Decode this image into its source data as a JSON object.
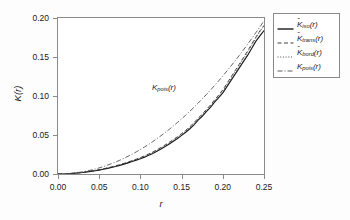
{
  "chart_data": {
    "type": "line",
    "title": "",
    "xlabel": "r",
    "ylabel": "K(r)",
    "xlim": [
      0.0,
      0.25
    ],
    "ylim": [
      0.0,
      0.2
    ],
    "xticks": [
      "0.00",
      "0.05",
      "0.10",
      "0.15",
      "0.20",
      "0.25"
    ],
    "xtick_values": [
      0.0,
      0.05,
      0.1,
      0.15,
      0.2,
      0.25
    ],
    "yticks": [
      "0.00",
      "0.05",
      "0.10",
      "0.15",
      "0.20"
    ],
    "ytick_values": [
      0.0,
      0.05,
      0.1,
      0.15,
      0.2
    ],
    "grid": false,
    "legend_position": "right-outside",
    "annotations": [
      {
        "text_prefix": "K",
        "text_sub": "pois",
        "text_suffix": "(r)",
        "x": 0.152,
        "y": 0.112
      }
    ],
    "x": [
      0.0,
      0.005,
      0.01,
      0.015,
      0.02,
      0.025,
      0.03,
      0.035,
      0.04,
      0.045,
      0.05,
      0.055,
      0.06,
      0.065,
      0.07,
      0.075,
      0.08,
      0.085,
      0.09,
      0.095,
      0.1,
      0.105,
      0.11,
      0.115,
      0.12,
      0.125,
      0.13,
      0.135,
      0.14,
      0.145,
      0.15,
      0.155,
      0.16,
      0.165,
      0.17,
      0.175,
      0.18,
      0.185,
      0.19,
      0.195,
      0.2,
      0.205,
      0.21,
      0.215,
      0.22,
      0.225,
      0.23,
      0.235,
      0.24,
      0.245,
      0.25
    ],
    "series": [
      {
        "name": "K_iso",
        "label_prefix": "K",
        "label_sub": "iso",
        "label_suffix": "(r)",
        "hat": true,
        "style": "solid",
        "color": "#1a1a1a",
        "values": [
          0.0,
          0.0,
          0.0,
          0.0005,
          0.0009,
          0.0014,
          0.0019,
          0.0026,
          0.0033,
          0.0041,
          0.005,
          0.0061,
          0.0072,
          0.0084,
          0.0096,
          0.011,
          0.0126,
          0.0143,
          0.016,
          0.0178,
          0.0196,
          0.0216,
          0.024,
          0.0264,
          0.0292,
          0.032,
          0.0352,
          0.0385,
          0.042,
          0.0455,
          0.0495,
          0.0535,
          0.058,
          0.063,
          0.069,
          0.074,
          0.08,
          0.0855,
          0.092,
          0.098,
          0.104,
          0.112,
          0.12,
          0.128,
          0.136,
          0.144,
          0.152,
          0.161,
          0.17,
          0.177,
          0.184
        ]
      },
      {
        "name": "K_trans",
        "label_prefix": "K",
        "label_sub": "trans",
        "label_suffix": "(r)",
        "hat": true,
        "style": "dashed",
        "color": "#2a2a2a",
        "values": [
          0.0,
          0.0,
          0.0001,
          0.0006,
          0.0011,
          0.0016,
          0.0022,
          0.0029,
          0.0037,
          0.0046,
          0.0056,
          0.0067,
          0.0079,
          0.0092,
          0.0105,
          0.012,
          0.0136,
          0.0154,
          0.0172,
          0.019,
          0.021,
          0.0232,
          0.0256,
          0.0282,
          0.031,
          0.034,
          0.0372,
          0.0406,
          0.0442,
          0.0478,
          0.0518,
          0.056,
          0.0606,
          0.0658,
          0.0714,
          0.0768,
          0.0826,
          0.0884,
          0.095,
          0.1012,
          0.108,
          0.116,
          0.1244,
          0.1326,
          0.1408,
          0.1492,
          0.1576,
          0.1664,
          0.1752,
          0.1834,
          0.1905
        ]
      },
      {
        "name": "K_bord",
        "label_prefix": "K",
        "label_sub": "bord",
        "label_suffix": "(r)",
        "hat": true,
        "style": "dotted",
        "color": "#3a3a3a",
        "values": [
          0.0,
          0.0,
          0.0001,
          0.0005,
          0.001,
          0.0015,
          0.002,
          0.0027,
          0.0035,
          0.0043,
          0.0053,
          0.0064,
          0.0076,
          0.0088,
          0.0101,
          0.0116,
          0.0132,
          0.0149,
          0.0166,
          0.0185,
          0.0205,
          0.0226,
          0.025,
          0.0275,
          0.0303,
          0.0332,
          0.0364,
          0.0398,
          0.0433,
          0.047,
          0.0509,
          0.055,
          0.0596,
          0.0648,
          0.0704,
          0.0756,
          0.0814,
          0.0872,
          0.0936,
          0.0998,
          0.1064,
          0.1144,
          0.1228,
          0.131,
          0.1392,
          0.1476,
          0.156,
          0.165,
          0.174,
          0.1825,
          0.19
        ]
      },
      {
        "name": "K_pois",
        "label_prefix": "K",
        "label_sub": "pois",
        "label_suffix": "(r)",
        "hat": false,
        "style": "dashdot",
        "color": "#4a4a4a",
        "values": [
          0.0,
          8e-05,
          0.00031,
          0.00071,
          0.00126,
          0.00196,
          0.00283,
          0.00385,
          0.00503,
          0.00636,
          0.00785,
          0.0095,
          0.01131,
          0.01327,
          0.01539,
          0.01767,
          0.02011,
          0.0227,
          0.02545,
          0.02835,
          0.03142,
          0.03464,
          0.03801,
          0.04155,
          0.04524,
          0.04909,
          0.05309,
          0.05726,
          0.06158,
          0.06605,
          0.07069,
          0.07548,
          0.08042,
          0.08553,
          0.09079,
          0.09621,
          0.10179,
          0.10752,
          0.11341,
          0.11946,
          0.12566,
          0.13203,
          0.13854,
          0.14522,
          0.15205,
          0.15904,
          0.16619,
          0.17349,
          0.18096,
          0.18857,
          0.19635
        ]
      }
    ]
  }
}
